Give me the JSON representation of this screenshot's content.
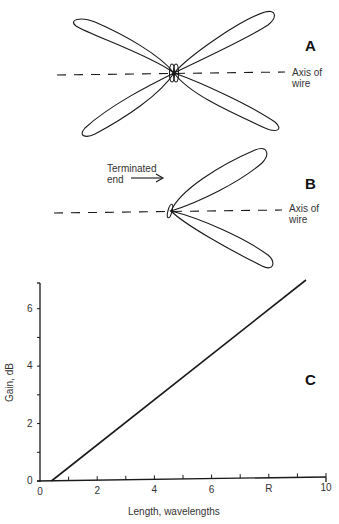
{
  "panels": {
    "A": {
      "letter": "A",
      "axis_label_line1": "Axis of",
      "axis_label_line2": "wire",
      "description": "Four-lobe radiation pattern of a long-wire antenna (unterminated)"
    },
    "B": {
      "letter": "B",
      "axis_label_line1": "Axis of",
      "axis_label_line2": "wire",
      "terminated_label_line1": "Terminated",
      "terminated_label_line2": "end",
      "description": "Two-lobe radiation pattern of a terminated long-wire antenna"
    },
    "C": {
      "letter": "C"
    }
  },
  "chart_data": {
    "type": "line",
    "title": "",
    "xlabel": "Length, wavelengths",
    "ylabel": "Gain, dB",
    "xlim": [
      0,
      10
    ],
    "ylim": [
      0,
      7
    ],
    "x_ticks": [
      0,
      2,
      4,
      6,
      8,
      10
    ],
    "x_tick_labels": [
      "0",
      "2",
      "4",
      "6",
      "R",
      "10"
    ],
    "x_minor_ticks": [
      1,
      3,
      5,
      7,
      9
    ],
    "y_ticks": [
      0,
      2,
      4,
      6
    ],
    "y_tick_labels": [
      "0",
      "2",
      "4",
      "6"
    ],
    "y_minor_ticks": [
      1,
      3,
      5
    ],
    "grid": false,
    "legend": null,
    "series": [
      {
        "name": "Gain vs length",
        "x": [
          0.4,
          9.3
        ],
        "y": [
          0,
          7.0
        ]
      }
    ]
  }
}
